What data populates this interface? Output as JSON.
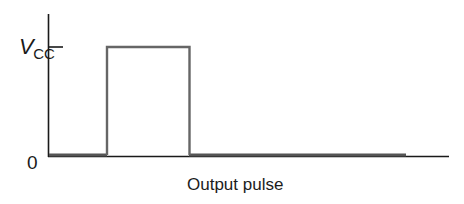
{
  "diagram": {
    "title": "Output pulse",
    "caption": "Output pulse",
    "y_axis": {
      "top_label_main": "V",
      "top_label_sub": "CC",
      "bottom_label": "0"
    },
    "waveform": {
      "type": "single rectangular pulse",
      "low_level": "0",
      "high_level": "VCC"
    },
    "colors": {
      "axis": "#1a1a1a",
      "signal": "#5a5a5a",
      "text": "#1a1a1a"
    }
  }
}
